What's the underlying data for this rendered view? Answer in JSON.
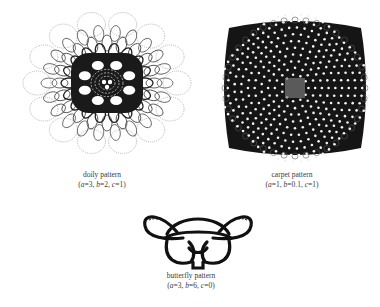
{
  "figures": [
    {
      "id": "doily",
      "name": "doily pattern",
      "params": {
        "a": "3",
        "b": "2",
        "c": "1"
      }
    },
    {
      "id": "carpet",
      "name": "carpet pattern",
      "params": {
        "a": "1",
        "b": "0.1",
        "c": "1"
      }
    },
    {
      "id": "butterfly",
      "name": "butterfly pattern",
      "params": {
        "a": "3",
        "b": "6",
        "c": "0"
      }
    }
  ],
  "colors": {
    "ink": "#111111",
    "light_ink": "#8a8a8a",
    "background": "#ffffff"
  }
}
